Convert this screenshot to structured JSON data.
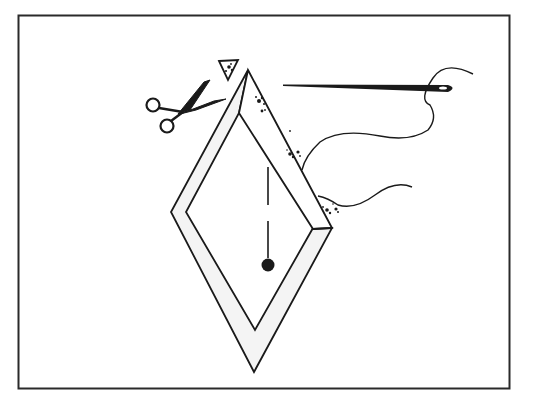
{
  "figure": {
    "elements": [
      {
        "name": "frame-border",
        "label": "Rectangular border"
      },
      {
        "name": "diamond-frame",
        "label": "Diamond with binding strip"
      },
      {
        "name": "trimmed-triangle",
        "label": "Cut-off corner triangle"
      },
      {
        "name": "scissors-icon",
        "label": "Scissors"
      },
      {
        "name": "needle-icon",
        "label": "Threaded needle"
      },
      {
        "name": "thread",
        "label": "Thread"
      },
      {
        "name": "center-line",
        "label": "Dashed center line with dot"
      }
    ]
  },
  "colors": {
    "ink": "#1a1a1a",
    "paper": "#ffffff",
    "strip_fill": "#f4f4f4"
  }
}
